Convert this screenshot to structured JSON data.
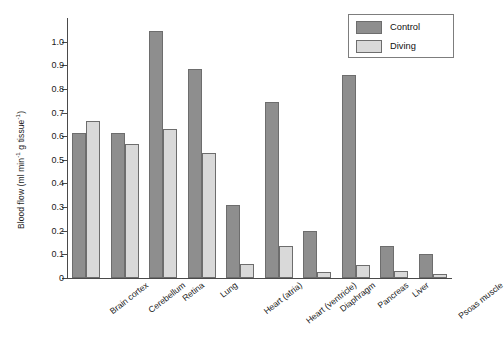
{
  "chart_data": {
    "type": "bar",
    "title": "",
    "xlabel": "",
    "ylabel": "Blood flow (ml min⁻¹ g tissue⁻¹)",
    "ylabel_parts": {
      "base": "Blood flow (ml min",
      "sup1": "-1",
      "mid": " g tissue",
      "sup2": "-1",
      "close": ")"
    },
    "ylim": [
      0,
      1.1
    ],
    "yticks": [
      0,
      0.1,
      0.2,
      0.3,
      0.4,
      0.5,
      0.6,
      0.7,
      0.8,
      0.9,
      1.0
    ],
    "ytick_labels": [
      "0",
      "0.1",
      "0.2",
      "0.3",
      "0.4",
      "0.5",
      "0.6",
      "0.7",
      "0.8",
      "0.9",
      "1.0"
    ],
    "grid": false,
    "legend_position": "top-right",
    "categories": [
      "Brain cortex",
      "Cerebellum",
      "Retina",
      "Lung",
      "Heart (atria)",
      "Heart (ventricle)",
      "Diaphragm",
      "Pancreas",
      "Liver",
      "Psoas muscle"
    ],
    "series": [
      {
        "name": "Control",
        "color": "#8e8e8e",
        "values": [
          0.615,
          0.615,
          1.045,
          0.885,
          0.31,
          0.745,
          0.197,
          0.86,
          0.135,
          0.1
        ]
      },
      {
        "name": "Diving",
        "color": "#d9d9d9",
        "values": [
          0.665,
          0.567,
          0.632,
          0.528,
          0.06,
          0.135,
          0.025,
          0.055,
          0.03,
          0.015
        ]
      }
    ]
  },
  "legend": {
    "entries": [
      {
        "label": "Control",
        "color": "#8e8e8e"
      },
      {
        "label": "Diving",
        "color": "#d9d9d9"
      }
    ]
  },
  "colors": {
    "control": "#8e8e8e",
    "diving": "#d9d9d9",
    "axis": "#4a4a4a",
    "text": "#1a1a1a",
    "background": "#ffffff"
  }
}
